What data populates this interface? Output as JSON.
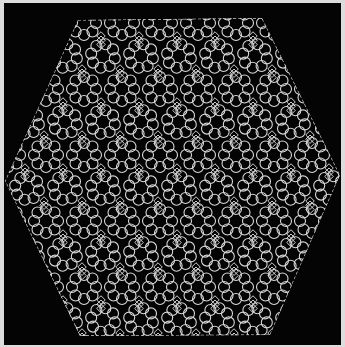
{
  "image": {
    "description": "Photograph of a white hexagonal lace (tatted) doily on a black background",
    "subject": "lace-doily",
    "shape": "hexagon",
    "colors": {
      "background": "#040404",
      "lace": "#d8d8d8",
      "frame": "#dcdcdc"
    },
    "pattern": {
      "motif": "rosette-rings-around-dark-openings",
      "rows": 9
    }
  }
}
